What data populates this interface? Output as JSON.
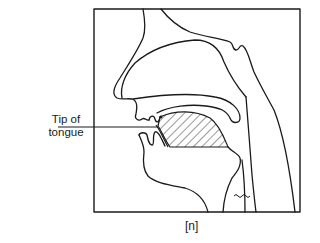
{
  "diagram": {
    "label_tip": [
      "Tip of",
      "tongue"
    ],
    "caption": "[n]",
    "colors": {
      "line": "#1a1a1a",
      "background": "#ffffff"
    }
  }
}
